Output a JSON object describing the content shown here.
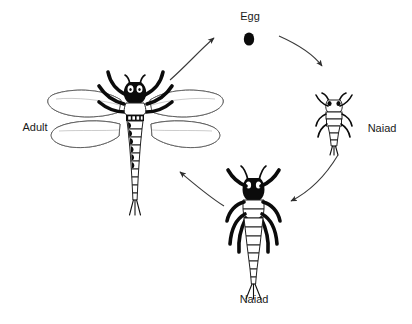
{
  "diagram": {
    "background_color": "#ffffff",
    "ink_color": "#111111",
    "arrow_color": "#3a3a3a",
    "label_color": "#1a1a1a",
    "stages": [
      {
        "id": "egg",
        "label": "Egg",
        "label_x": 250,
        "label_y": 20,
        "figure_x": 249,
        "figure_y": 39,
        "icon": "egg-oval-icon"
      },
      {
        "id": "naiad-early",
        "label": "Naiad",
        "label_x": 382,
        "label_y": 132,
        "figure_x": 334,
        "figure_y": 122,
        "icon": "naiad-small-icon"
      },
      {
        "id": "naiad-late",
        "label": "Naiad",
        "label_x": 254,
        "label_y": 303,
        "figure_x": 253,
        "figure_y": 228,
        "icon": "naiad-large-icon"
      },
      {
        "id": "adult",
        "label": "Adult",
        "label_x": 35,
        "label_y": 131,
        "figure_x": 134,
        "figure_y": 145,
        "icon": "dragonfly-adult-icon"
      }
    ],
    "arrows": [
      {
        "id": "adult-to-egg",
        "from": "adult",
        "to": "egg"
      },
      {
        "id": "egg-to-naiad-early",
        "from": "egg",
        "to": "naiad-early"
      },
      {
        "id": "naiad-early-to-naiad-late",
        "from": "naiad-early",
        "to": "naiad-late"
      },
      {
        "id": "naiad-late-to-adult",
        "from": "naiad-late",
        "to": "adult"
      }
    ]
  }
}
